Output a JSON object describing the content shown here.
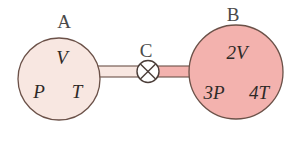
{
  "diagram": {
    "background_color": "#ffffff",
    "vessel_a": {
      "label": "A",
      "volume_text": "V",
      "pressure_temp_text_left": "P",
      "pressure_temp_text_right": "T",
      "fill_color": "#f8e7e1",
      "stroke_color": "#6b5148"
    },
    "vessel_b": {
      "label": "B",
      "volume_text": "2V",
      "pressure_temp_text_left": "3P",
      "pressure_temp_text_right": "4T",
      "fill_color": "#f3b2ae",
      "stroke_color": "#6b5148"
    },
    "valve": {
      "label": "C",
      "icon": "crossed-circle-valve-icon",
      "fill_color": "#ffffff",
      "stroke_color": "#4a3d38"
    },
    "pipe": {
      "left_segment_color": "#f8e7e1",
      "right_segment_color": "#f3b2ae",
      "stroke_color": "#6b5148"
    }
  }
}
